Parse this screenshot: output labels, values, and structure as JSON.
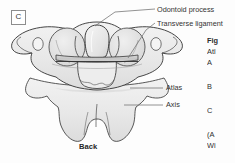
{
  "figure": {
    "panel_letter": "C",
    "orientation_label": "Back",
    "view_description": "Posterior view of the atlas and axis vertebrae",
    "bone_fill_color": "#e9e9e9",
    "outline_color": "#3c3c3c",
    "shadow_color": "#bdbdbd",
    "leader_line_color": "#6f6f6f",
    "background_color": "#fdfdfd"
  },
  "callouts": [
    {
      "id": "odontoid-process",
      "label": "Odontoid process",
      "leader": "angled line from label down-left to the dens at top centre of axis"
    },
    {
      "id": "transverse-ligament",
      "label": "Transverse ligament",
      "leader": "angled line from label down-left to the horizontal band behind the dens"
    },
    {
      "id": "atlas",
      "label": "Atlas",
      "leader": "horizontal line from label left to the atlas ring"
    },
    {
      "id": "axis",
      "label": "Axis",
      "leader": "horizontal line from label left to the axis body"
    }
  ],
  "caption": {
    "fig_label": "Fig",
    "title": "Atl",
    "item_a": "A",
    "item_b": "B",
    "item_c": "C",
    "source_line_1": "(A",
    "source_line_2": "Wi",
    "note": "caption column is clipped by the right edge of the screenshot"
  }
}
